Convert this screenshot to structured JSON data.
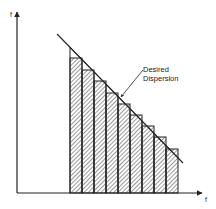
{
  "diagram": {
    "y_axis_label": "f",
    "x_axis_label": "f",
    "annotation": {
      "line1": "Desired",
      "line2": "Dispersion"
    },
    "colors": {
      "stroke": "#222222",
      "hatch": "#333333",
      "background": "#ffffff"
    }
  },
  "chart_data": {
    "type": "bar",
    "title": "",
    "xlabel": "f",
    "ylabel": "f",
    "categories": [
      "1",
      "2",
      "3",
      "4",
      "5",
      "6",
      "7",
      "8",
      "9"
    ],
    "values": [
      135,
      123,
      112,
      100,
      89,
      78,
      67,
      56,
      44
    ],
    "reference_line": {
      "label": "Desired Dispersion",
      "type": "linear-decreasing"
    },
    "grid": false,
    "legend": "none"
  }
}
